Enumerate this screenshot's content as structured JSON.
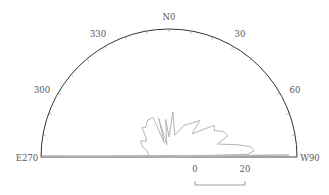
{
  "chart_data": {
    "type": "rose",
    "subtype": "half-circle polar line (rose) diagram",
    "title": "",
    "direction_labels": [
      {
        "angle": 270,
        "text": "E270"
      },
      {
        "angle": 300,
        "text": "300"
      },
      {
        "angle": 330,
        "text": "330"
      },
      {
        "angle": 0,
        "text": "N0"
      },
      {
        "angle": 30,
        "text": "30"
      },
      {
        "angle": 60,
        "text": "60"
      },
      {
        "angle": 90,
        "text": "W90"
      }
    ],
    "tick_interval_deg": 10,
    "scale_bar": {
      "start_label": "0",
      "end_label": "20",
      "units_per_bar": 20
    },
    "radius_units": 51,
    "angular_range": [
      270,
      90
    ],
    "series": [
      {
        "name": "rose",
        "points": [
          {
            "angle": 270,
            "value": 0
          },
          {
            "angle": 272,
            "value": 5
          },
          {
            "angle": 275,
            "value": 8
          },
          {
            "angle": 285,
            "value": 9
          },
          {
            "angle": 290,
            "value": 11
          },
          {
            "angle": 295,
            "value": 12
          },
          {
            "angle": 300,
            "value": 13
          },
          {
            "angle": 305,
            "value": 11
          },
          {
            "angle": 310,
            "value": 12
          },
          {
            "angle": 318,
            "value": 16
          },
          {
            "angle": 322,
            "value": 15
          },
          {
            "angle": 330,
            "value": 17
          },
          {
            "angle": 338,
            "value": 17
          },
          {
            "angle": 342,
            "value": 6
          },
          {
            "angle": 345,
            "value": 16
          },
          {
            "angle": 350,
            "value": 5
          },
          {
            "angle": 355,
            "value": 15
          },
          {
            "angle": 0,
            "value": 8
          },
          {
            "angle": 5,
            "value": 18
          },
          {
            "angle": 15,
            "value": 9
          },
          {
            "angle": 25,
            "value": 14
          },
          {
            "angle": 30,
            "value": 15
          },
          {
            "angle": 40,
            "value": 19
          },
          {
            "angle": 45,
            "value": 13
          },
          {
            "angle": 55,
            "value": 22
          },
          {
            "angle": 60,
            "value": 21
          },
          {
            "angle": 65,
            "value": 24
          },
          {
            "angle": 70,
            "value": 25
          },
          {
            "angle": 75,
            "value": 20
          },
          {
            "angle": 80,
            "value": 28
          },
          {
            "angle": 83,
            "value": 33
          },
          {
            "angle": 86,
            "value": 34
          },
          {
            "angle": 88,
            "value": 31
          },
          {
            "angle": 90,
            "value": 0
          }
        ]
      }
    ],
    "grid": false,
    "legend": null
  },
  "colors": {
    "axis": "#333333",
    "rose_line": "#b0b0b0",
    "label": "#555555"
  }
}
